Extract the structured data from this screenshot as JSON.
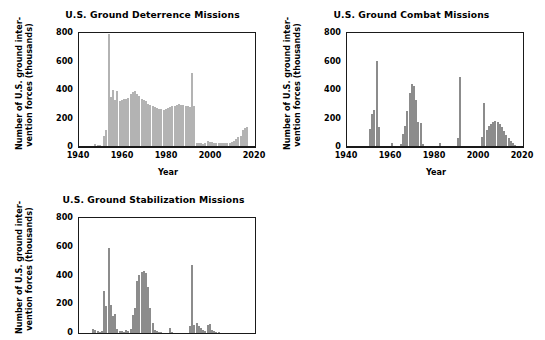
{
  "figure": {
    "background": "#ffffff",
    "axis_color": "#1a1a1a",
    "panel_count": 3
  },
  "panels": [
    {
      "id": "deterrence",
      "title": "U.S. Ground Deterrence Missions",
      "ylabel_line1": "Number of U.S. ground inter-",
      "ylabel_line2": "vention forces (thousands)",
      "xlabel": "Year",
      "bar_color": "#b3b3b3",
      "cropped_bottom": false
    },
    {
      "id": "combat",
      "title": "U.S. Ground Combat Missions",
      "ylabel_line1": "Number of U.S. ground inter-",
      "ylabel_line2": "vention forces (thousands)",
      "xlabel": "Year",
      "bar_color": "#8c8c8c",
      "cropped_bottom": false
    },
    {
      "id": "stabilize",
      "title": "U.S. Ground Stabilization Missions",
      "ylabel_line1": "Number of U.S. ground inter-",
      "ylabel_line2": "vention forces (thousands)",
      "xlabel": "",
      "bar_color": "#8c8c8c",
      "cropped_bottom": true
    }
  ],
  "axes": {
    "y_ticks": [
      0,
      200,
      400,
      600,
      800
    ],
    "y_tick_labels": [
      "0",
      "200",
      "400",
      "600",
      "800"
    ],
    "ylim": [
      0,
      800
    ],
    "x_ticks": [
      1940,
      1960,
      1980,
      2000,
      2020
    ],
    "x_tick_labels": [
      "1940",
      "1960",
      "1980",
      "2000",
      "2020"
    ],
    "xlim": [
      1940,
      2020
    ],
    "grid": false,
    "legend": "none"
  },
  "chart_data": [
    {
      "type": "bar",
      "id": "deterrence",
      "title": "U.S. Ground Deterrence Missions",
      "xlabel": "Year",
      "ylabel": "Number of U.S. ground intervention forces (thousands)",
      "xlim": [
        1940,
        2020
      ],
      "ylim": [
        0,
        800
      ],
      "grid": false,
      "legend": "none",
      "color": "#b3b3b3",
      "x": [
        1940,
        1941,
        1942,
        1943,
        1944,
        1945,
        1946,
        1947,
        1948,
        1949,
        1950,
        1951,
        1952,
        1953,
        1954,
        1955,
        1956,
        1957,
        1958,
        1959,
        1960,
        1961,
        1962,
        1963,
        1964,
        1965,
        1966,
        1967,
        1968,
        1969,
        1970,
        1971,
        1972,
        1973,
        1974,
        1975,
        1976,
        1977,
        1978,
        1979,
        1980,
        1981,
        1982,
        1983,
        1984,
        1985,
        1986,
        1987,
        1988,
        1989,
        1990,
        1991,
        1992,
        1993,
        1994,
        1995,
        1996,
        1997,
        1998,
        1999,
        2000,
        2001,
        2002,
        2003,
        2004,
        2005,
        2006,
        2007,
        2008,
        2009,
        2010,
        2011,
        2012,
        2013,
        2014,
        2015,
        2016
      ],
      "values": [
        0,
        0,
        0,
        0,
        0,
        0,
        8,
        18,
        16,
        14,
        10,
        80,
        120,
        790,
        350,
        400,
        330,
        395,
        320,
        330,
        340,
        335,
        345,
        370,
        385,
        390,
        375,
        360,
        340,
        330,
        320,
        305,
        295,
        285,
        280,
        275,
        270,
        265,
        262,
        268,
        272,
        280,
        285,
        290,
        295,
        300,
        298,
        292,
        290,
        285,
        280,
        520,
        285,
        30,
        25,
        25,
        22,
        30,
        40,
        38,
        35,
        30,
        28,
        28,
        30,
        28,
        26,
        25,
        28,
        32,
        40,
        58,
        68,
        75,
        120,
        130,
        140
      ]
    },
    {
      "type": "bar",
      "id": "combat",
      "title": "U.S. Ground Combat Missions",
      "xlabel": "Year",
      "ylabel": "Number of U.S. ground intervention forces (thousands)",
      "xlim": [
        1940,
        2020
      ],
      "ylim": [
        0,
        800
      ],
      "grid": false,
      "legend": "none",
      "color": "#8c8c8c",
      "x": [
        1940,
        1941,
        1942,
        1943,
        1944,
        1945,
        1946,
        1947,
        1948,
        1949,
        1950,
        1951,
        1952,
        1953,
        1954,
        1955,
        1956,
        1957,
        1958,
        1959,
        1960,
        1961,
        1962,
        1963,
        1964,
        1965,
        1966,
        1967,
        1968,
        1969,
        1970,
        1971,
        1972,
        1973,
        1974,
        1975,
        1976,
        1977,
        1978,
        1979,
        1980,
        1981,
        1982,
        1983,
        1984,
        1985,
        1986,
        1987,
        1988,
        1989,
        1990,
        1991,
        1992,
        1993,
        1994,
        1995,
        1996,
        1997,
        1998,
        1999,
        2000,
        2001,
        2002,
        2003,
        2004,
        2005,
        2006,
        2007,
        2008,
        2009,
        2010,
        2011,
        2012,
        2013,
        2014,
        2015,
        2016
      ],
      "values": [
        0,
        0,
        0,
        0,
        0,
        0,
        0,
        0,
        0,
        0,
        125,
        230,
        260,
        605,
        140,
        5,
        3,
        2,
        2,
        3,
        30,
        5,
        4,
        8,
        20,
        90,
        150,
        250,
        380,
        440,
        430,
        330,
        175,
        170,
        20,
        8,
        5,
        4,
        3,
        4,
        5,
        4,
        30,
        10,
        4,
        3,
        4,
        3,
        5,
        3,
        60,
        490,
        10,
        8,
        5,
        4,
        3,
        3,
        4,
        5,
        6,
        70,
        310,
        120,
        150,
        165,
        175,
        180,
        175,
        160,
        140,
        110,
        85,
        60,
        40,
        25,
        15
      ]
    },
    {
      "type": "bar",
      "id": "stabilize",
      "title": "U.S. Ground Stabilization Missions",
      "xlabel": "",
      "ylabel": "Number of U.S. ground intervention forces (thousands)",
      "xlim": [
        1940,
        2020
      ],
      "ylim": [
        0,
        800
      ],
      "grid": false,
      "legend": "none",
      "color": "#8c8c8c",
      "x": [
        1940,
        1941,
        1942,
        1943,
        1944,
        1945,
        1946,
        1947,
        1948,
        1949,
        1950,
        1951,
        1952,
        1953,
        1954,
        1955,
        1956,
        1957,
        1958,
        1959,
        1960,
        1961,
        1962,
        1963,
        1964,
        1965,
        1966,
        1967,
        1968,
        1969,
        1970,
        1971,
        1972,
        1973,
        1974,
        1975,
        1976,
        1977,
        1978,
        1979,
        1980,
        1981,
        1982,
        1983,
        1984,
        1985,
        1986,
        1987,
        1988,
        1989,
        1990,
        1991,
        1992,
        1993,
        1994,
        1995,
        1996,
        1997,
        1998,
        1999,
        2000,
        2001,
        2002,
        2003,
        2004,
        2005,
        2006,
        2007,
        2008,
        2009,
        2010,
        2011,
        2012,
        2013,
        2014,
        2015,
        2016
      ],
      "values": [
        0,
        0,
        0,
        0,
        0,
        0,
        35,
        30,
        18,
        12,
        20,
        300,
        195,
        600,
        200,
        125,
        140,
        35,
        20,
        18,
        15,
        25,
        20,
        35,
        130,
        180,
        370,
        410,
        430,
        440,
        425,
        325,
        180,
        80,
        30,
        20,
        15,
        12,
        10,
        8,
        6,
        40,
        12,
        8,
        6,
        5,
        8,
        6,
        5,
        4,
        55,
        480,
        60,
        75,
        55,
        40,
        25,
        20,
        60,
        70,
        30,
        20,
        15,
        12,
        10,
        8,
        6,
        5,
        4,
        3,
        2,
        2,
        1,
        1,
        1,
        1,
        1
      ]
    }
  ]
}
